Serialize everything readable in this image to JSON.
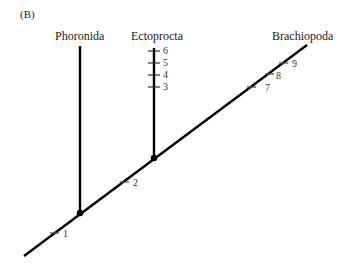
{
  "panel_label": "(B)",
  "taxa": {
    "phoronida": "Phoronida",
    "ectoprocta": "Ectoprocta",
    "brachiopoda": "Brachiopoda"
  },
  "characters": {
    "c1": "1",
    "c2": "2",
    "c3": "3",
    "c4": "4",
    "c5": "5",
    "c6": "6",
    "c7": "7",
    "c8": "8",
    "c9": "9"
  },
  "colors": {
    "line": "#000000",
    "tick": "#555555",
    "text": "#1a1a1a"
  }
}
